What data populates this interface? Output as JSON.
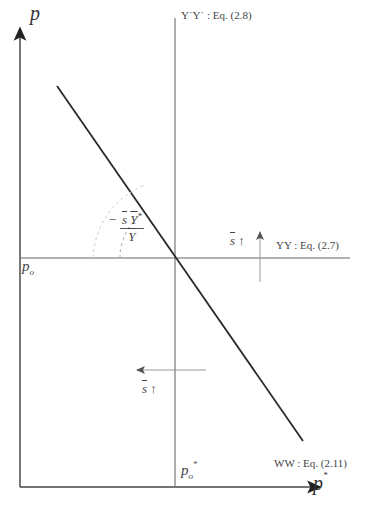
{
  "diagram": {
    "axes": {
      "y_label": "p",
      "x_label": "p",
      "x_label_sup": "*"
    },
    "curves": {
      "yy_star": {
        "label": "Y*Y*",
        "text": "Y˙Y˙ :  Eq. (2.8)"
      },
      "yy": {
        "label": "YY",
        "text": "YY :  Eq. (2.7)"
      },
      "ww": {
        "label": "WW",
        "text": "WW :  Eq. (2.11)"
      }
    },
    "points": {
      "po": {
        "base": "p",
        "sub": "o"
      },
      "po_star": {
        "base": "p",
        "sub": "o",
        "sup": "*"
      }
    },
    "slope_annotation": {
      "sign": "−",
      "numerator": "s Y*",
      "numerator_s": "s",
      "numerator_Y": "Y",
      "numerator_sup": "*",
      "denominator": "Y"
    },
    "shift_annotations": [
      {
        "id": "yy-shift",
        "text": "s",
        "arrow": "↑",
        "direction": "up"
      },
      {
        "id": "yystar-shift",
        "text": "s",
        "arrow": "↑",
        "direction": "left"
      }
    ],
    "colors": {
      "axis": "#333333",
      "ww_line": "#2a2a2a",
      "yy_lines": "#666666",
      "shift_arrows": "#888888",
      "angle_arc": "#bbbbbb"
    }
  }
}
